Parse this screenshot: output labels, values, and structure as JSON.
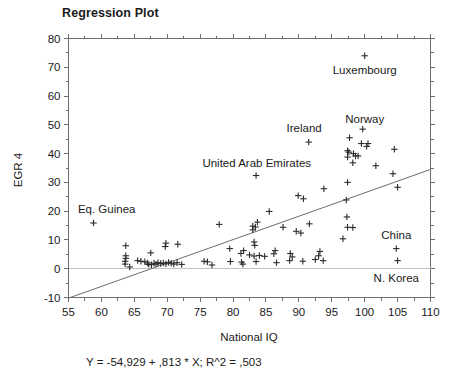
{
  "chart_data": {
    "type": "scatter",
    "title": "Regression Plot",
    "xlabel": "National IQ",
    "ylabel": "EGR 4",
    "xlim": [
      55,
      110
    ],
    "ylim": [
      -10,
      80
    ],
    "xticks": [
      55,
      60,
      65,
      70,
      75,
      80,
      85,
      90,
      95,
      100,
      105,
      110
    ],
    "yticks": [
      -10,
      0,
      10,
      20,
      30,
      40,
      50,
      60,
      70,
      80
    ],
    "xtick_labels": [
      "55",
      "60",
      "65",
      "70",
      "75",
      "80",
      "85",
      "90",
      "95",
      "100",
      "105",
      "110"
    ],
    "ytick_labels": [
      "-10",
      "0",
      "10",
      "20",
      "30",
      "40",
      "50",
      "60",
      "70",
      "80"
    ],
    "x_minor_step": 2.5,
    "y_minor_step": 5,
    "grid": false,
    "legend": "none",
    "marker": "plus",
    "equation": "Y = -54,929 + ,813 * X; R^2 = ,503",
    "fit": {
      "intercept": -54.929,
      "slope": 0.813,
      "r_squared": 0.503,
      "x_start": 55,
      "x_end": 110
    },
    "annotations": [
      {
        "text": "Luxembourg",
        "x": 100.0,
        "y": 67.5,
        "anchor": "middle"
      },
      {
        "text": "Norway",
        "x": 100.0,
        "y": 50.5,
        "anchor": "middle"
      },
      {
        "text": "Ireland",
        "x": 90.8,
        "y": 47.5,
        "anchor": "middle"
      },
      {
        "text": "United Arab Emirates",
        "x": 83.6,
        "y": 35.5,
        "anchor": "middle"
      },
      {
        "text": "Eq. Guinea",
        "x": 60.8,
        "y": 19.5,
        "anchor": "middle"
      },
      {
        "text": "China",
        "x": 104.8,
        "y": 10.5,
        "anchor": "middle"
      },
      {
        "text": "N. Korea",
        "x": 104.8,
        "y": -4.5,
        "anchor": "middle"
      }
    ],
    "points": [
      {
        "x": 100.0,
        "y": 74.0
      },
      {
        "x": 99.7,
        "y": 48.5
      },
      {
        "x": 97.7,
        "y": 45.5
      },
      {
        "x": 99.5,
        "y": 43.5
      },
      {
        "x": 100.5,
        "y": 43.5
      },
      {
        "x": 100.3,
        "y": 42.5
      },
      {
        "x": 97.4,
        "y": 41.0
      },
      {
        "x": 97.6,
        "y": 40.5
      },
      {
        "x": 98.3,
        "y": 40.0
      },
      {
        "x": 98.6,
        "y": 39.2
      },
      {
        "x": 97.4,
        "y": 38.8
      },
      {
        "x": 99.0,
        "y": 39.2
      },
      {
        "x": 98.2,
        "y": 36.8
      },
      {
        "x": 104.5,
        "y": 41.5
      },
      {
        "x": 101.7,
        "y": 35.8
      },
      {
        "x": 91.5,
        "y": 44.0
      },
      {
        "x": 83.5,
        "y": 32.4
      },
      {
        "x": 104.3,
        "y": 33.0
      },
      {
        "x": 97.4,
        "y": 30.0
      },
      {
        "x": 105.0,
        "y": 28.3
      },
      {
        "x": 93.8,
        "y": 27.8
      },
      {
        "x": 89.9,
        "y": 25.4
      },
      {
        "x": 90.7,
        "y": 24.3
      },
      {
        "x": 97.2,
        "y": 23.9
      },
      {
        "x": 85.5,
        "y": 19.9
      },
      {
        "x": 97.3,
        "y": 18.0
      },
      {
        "x": 58.8,
        "y": 15.9
      },
      {
        "x": 77.9,
        "y": 15.4
      },
      {
        "x": 83.7,
        "y": 16.2
      },
      {
        "x": 83.0,
        "y": 14.8
      },
      {
        "x": 83.0,
        "y": 13.5
      },
      {
        "x": 83.4,
        "y": 14.5
      },
      {
        "x": 91.6,
        "y": 15.6
      },
      {
        "x": 87.6,
        "y": 14.4
      },
      {
        "x": 89.6,
        "y": 13.0
      },
      {
        "x": 90.3,
        "y": 12.4
      },
      {
        "x": 97.4,
        "y": 14.4
      },
      {
        "x": 98.2,
        "y": 14.3
      },
      {
        "x": 96.7,
        "y": 10.4
      },
      {
        "x": 104.8,
        "y": 7.0
      },
      {
        "x": 105.0,
        "y": 2.8
      },
      {
        "x": 63.7,
        "y": 8.0
      },
      {
        "x": 69.8,
        "y": 8.9
      },
      {
        "x": 69.7,
        "y": 7.7
      },
      {
        "x": 71.6,
        "y": 8.5
      },
      {
        "x": 83.2,
        "y": 9.3
      },
      {
        "x": 83.3,
        "y": 8.1
      },
      {
        "x": 79.5,
        "y": 7.0
      },
      {
        "x": 81.6,
        "y": 6.3
      },
      {
        "x": 81.2,
        "y": 5.3
      },
      {
        "x": 86.4,
        "y": 6.3
      },
      {
        "x": 86.2,
        "y": 5.2
      },
      {
        "x": 82.5,
        "y": 4.8
      },
      {
        "x": 83.2,
        "y": 4.4
      },
      {
        "x": 84.0,
        "y": 4.6
      },
      {
        "x": 84.8,
        "y": 4.3
      },
      {
        "x": 88.7,
        "y": 5.3
      },
      {
        "x": 89.0,
        "y": 4.1
      },
      {
        "x": 93.2,
        "y": 6.0
      },
      {
        "x": 93.0,
        "y": 4.5
      },
      {
        "x": 67.5,
        "y": 5.5
      },
      {
        "x": 63.7,
        "y": 4.5
      },
      {
        "x": 63.7,
        "y": 3.6
      },
      {
        "x": 63.6,
        "y": 2.6
      },
      {
        "x": 63.6,
        "y": 1.6
      },
      {
        "x": 64.3,
        "y": 0.6
      },
      {
        "x": 65.5,
        "y": 2.8
      },
      {
        "x": 66.0,
        "y": 2.6
      },
      {
        "x": 66.6,
        "y": 2.4
      },
      {
        "x": 67.0,
        "y": 2.0
      },
      {
        "x": 67.2,
        "y": 1.5
      },
      {
        "x": 67.6,
        "y": 1.4
      },
      {
        "x": 68.0,
        "y": 1.9
      },
      {
        "x": 68.3,
        "y": 1.6
      },
      {
        "x": 68.6,
        "y": 2.1
      },
      {
        "x": 69.0,
        "y": 1.8
      },
      {
        "x": 69.4,
        "y": 2.0
      },
      {
        "x": 69.8,
        "y": 1.7
      },
      {
        "x": 70.2,
        "y": 2.2
      },
      {
        "x": 70.6,
        "y": 1.9
      },
      {
        "x": 71.0,
        "y": 1.6
      },
      {
        "x": 71.5,
        "y": 2.1
      },
      {
        "x": 72.2,
        "y": 1.5
      },
      {
        "x": 75.6,
        "y": 2.6
      },
      {
        "x": 76.1,
        "y": 2.4
      },
      {
        "x": 76.8,
        "y": 1.3
      },
      {
        "x": 79.6,
        "y": 2.5
      },
      {
        "x": 81.3,
        "y": 2.3
      },
      {
        "x": 81.5,
        "y": 1.6
      },
      {
        "x": 83.5,
        "y": 2.5
      },
      {
        "x": 86.6,
        "y": 2.1
      },
      {
        "x": 88.6,
        "y": 2.8
      },
      {
        "x": 90.6,
        "y": 2.6
      },
      {
        "x": 92.5,
        "y": 3.2
      },
      {
        "x": 93.7,
        "y": 2.8
      }
    ]
  }
}
